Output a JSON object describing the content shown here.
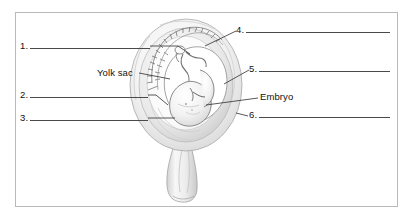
{
  "figure": {
    "style": "grayscale pencil-shaded anatomical illustration",
    "frame_color": "#b9b9b9",
    "line_color": "#4a4a4a",
    "text_color": "#111111",
    "background": "#ffffff"
  },
  "answer_lines": [
    {
      "id": "1",
      "number": "1.",
      "text": "",
      "side": "left"
    },
    {
      "id": "2",
      "number": "2.",
      "text": "",
      "side": "left"
    },
    {
      "id": "3",
      "number": "3.",
      "text": "",
      "side": "left"
    },
    {
      "id": "4",
      "number": "4.",
      "text": "",
      "side": "right"
    },
    {
      "id": "5",
      "number": "5.",
      "text": "",
      "side": "right"
    },
    {
      "id": "6",
      "number": "6.",
      "text": "",
      "side": "right"
    }
  ],
  "given_labels": [
    {
      "id": "yolk_sac",
      "text": "Yolk sac",
      "side": "left"
    },
    {
      "id": "embryo",
      "text": "Embryo",
      "side": "right"
    }
  ]
}
